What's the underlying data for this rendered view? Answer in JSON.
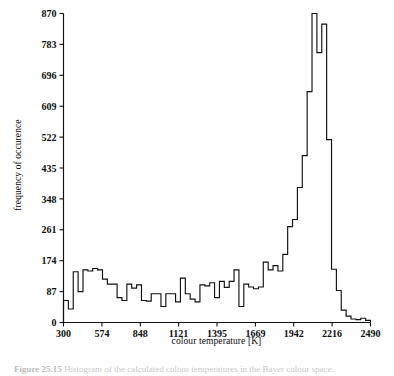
{
  "figure": {
    "caption_prefix": "Figure 25.15",
    "caption_text": "Histogram of the calculated colour temperatures in the Bayer colour space."
  },
  "chart_data": {
    "type": "bar",
    "title": "",
    "subtitle": "",
    "xlabel": "colour temperature [K]",
    "ylabel": "frequency of occurence",
    "xlim": [
      300,
      2490
    ],
    "ylim": [
      0,
      870
    ],
    "grid": false,
    "legend": "none",
    "xticks": [
      300,
      574,
      848,
      1121,
      1395,
      1669,
      1942,
      2216,
      2490
    ],
    "yticks": [
      0,
      87,
      174,
      261,
      348,
      435,
      522,
      609,
      696,
      783,
      870
    ],
    "bin_width": 39.8,
    "bin_count": 55,
    "categories": [
      "300-340",
      "340-380",
      "380-419",
      "419-459",
      "459-499",
      "499-539",
      "539-579",
      "579-618",
      "618-658",
      "658-698",
      "698-738",
      "738-778",
      "778-817",
      "817-857",
      "857-897",
      "897-937",
      "937-977",
      "977-1016",
      "1016-1056",
      "1056-1096",
      "1096-1136",
      "1136-1176",
      "1176-1215",
      "1215-1255",
      "1255-1295",
      "1295-1335",
      "1335-1375",
      "1375-1414",
      "1414-1454",
      "1454-1494",
      "1494-1534",
      "1534-1574",
      "1574-1613",
      "1613-1653",
      "1653-1693",
      "1693-1733",
      "1733-1773",
      "1773-1812",
      "1812-1852",
      "1852-1892",
      "1892-1932",
      "1932-1972",
      "1972-2011",
      "2011-2051",
      "2051-2091",
      "2091-2131",
      "2131-2171",
      "2171-2211",
      "2211-2250",
      "2250-2290",
      "2290-2330",
      "2330-2370",
      "2370-2410",
      "2410-2450",
      "2450-2490"
    ],
    "values": [
      62,
      38,
      143,
      87,
      148,
      145,
      152,
      148,
      122,
      108,
      108,
      70,
      62,
      108,
      97,
      106,
      62,
      60,
      81,
      81,
      45,
      81,
      81,
      58,
      125,
      81,
      66,
      58,
      106,
      103,
      112,
      70,
      116,
      99,
      116,
      148,
      45,
      108,
      100,
      95,
      100,
      170,
      148,
      160,
      145,
      192,
      270,
      290,
      380,
      470,
      650,
      870,
      760,
      840,
      515
    ],
    "tail_values": [
      150,
      90,
      35,
      18,
      10,
      8,
      12,
      6
    ],
    "peak": {
      "bin": "2131-2171",
      "value": 870
    },
    "min": {
      "bin": "340-380",
      "value": 38
    }
  }
}
